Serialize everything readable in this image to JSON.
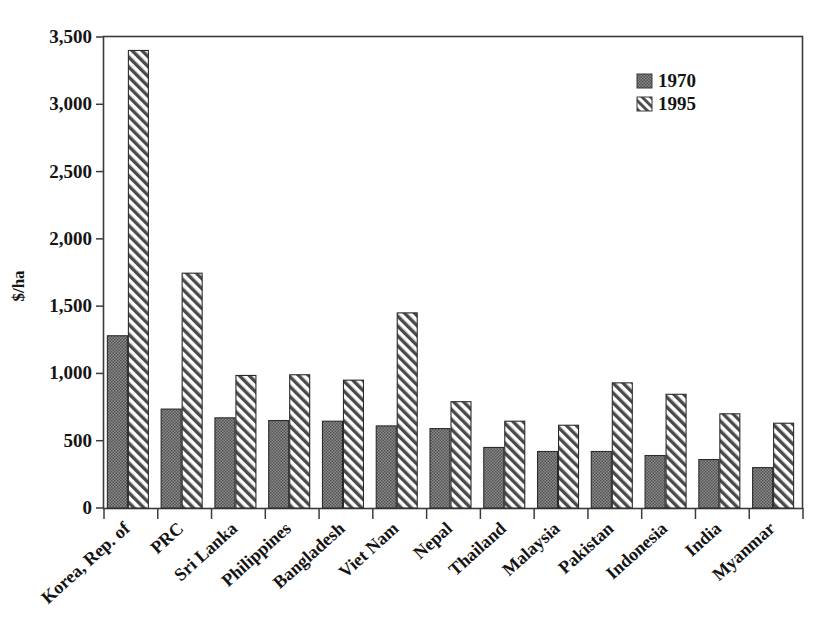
{
  "chart_data": {
    "type": "bar",
    "title": "",
    "xlabel": "",
    "ylabel": "$/ha",
    "ylim": [
      0,
      3500
    ],
    "ytick_step": 500,
    "ytick_labels": [
      "0",
      "500",
      "1,000",
      "1,500",
      "2,000",
      "2,500",
      "3,000",
      "3,500"
    ],
    "ytick_values": [
      0,
      500,
      1000,
      1500,
      2000,
      2500,
      3000,
      3500
    ],
    "grid": false,
    "legend_position": "top-right",
    "categories": [
      "Korea, Rep. of",
      "PRC",
      "Sri Lanka",
      "Philippines",
      "Bangladesh",
      "Viet Nam",
      "Nepal",
      "Thailand",
      "Malaysia",
      "Pakistan",
      "Indonesia",
      "India",
      "Myanmar"
    ],
    "series": [
      {
        "name": "1970",
        "pattern": "solid-gray-dotted",
        "color": "#6f6f6f",
        "values": [
          1280,
          735,
          670,
          650,
          645,
          610,
          590,
          450,
          420,
          420,
          390,
          360,
          300
        ]
      },
      {
        "name": "1995",
        "pattern": "diagonal-hatch",
        "color": "#ffffff",
        "values": [
          3400,
          1745,
          985,
          990,
          950,
          1450,
          790,
          645,
          615,
          930,
          845,
          700,
          630
        ]
      }
    ]
  },
  "legend": {
    "entries": [
      {
        "label": "1970"
      },
      {
        "label": "1995"
      }
    ]
  },
  "axes": {
    "y_title": "$/ha"
  }
}
